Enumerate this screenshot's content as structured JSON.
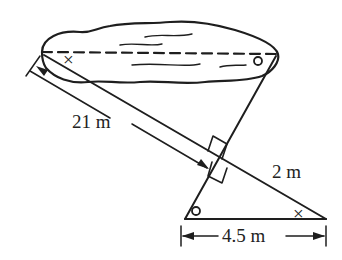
{
  "diagram": {
    "labels": {
      "hypotenuse_large": "21 m",
      "hypotenuse_small": "2 m",
      "base_small": "4.5 m"
    },
    "angle_marks": {
      "cross": "×",
      "circle": "o"
    },
    "colors": {
      "ink": "#1e1e1e",
      "background": "#ffffff"
    }
  }
}
